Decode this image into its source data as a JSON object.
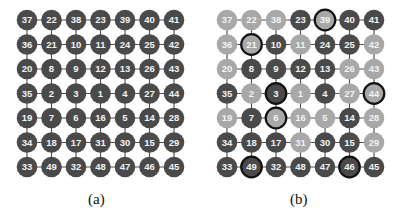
{
  "figure": {
    "panels": [
      {
        "id": "a",
        "caption": "(a)",
        "grid": [
          [
            37,
            22,
            38,
            23,
            39,
            40,
            41
          ],
          [
            36,
            21,
            10,
            11,
            24,
            25,
            42
          ],
          [
            20,
            8,
            9,
            12,
            13,
            26,
            43
          ],
          [
            35,
            2,
            3,
            1,
            4,
            27,
            44
          ],
          [
            19,
            7,
            6,
            16,
            5,
            14,
            28
          ],
          [
            34,
            18,
            17,
            31,
            30,
            15,
            29
          ],
          [
            33,
            49,
            32,
            48,
            47,
            46,
            45
          ]
        ],
        "shades": [
          [
            "D",
            "D",
            "D",
            "D",
            "D",
            "D",
            "D"
          ],
          [
            "D",
            "D",
            "D",
            "D",
            "D",
            "D",
            "D"
          ],
          [
            "D",
            "D",
            "D",
            "D",
            "D",
            "D",
            "D"
          ],
          [
            "D",
            "D",
            "D",
            "D",
            "D",
            "D",
            "D"
          ],
          [
            "D",
            "D",
            "D",
            "D",
            "D",
            "D",
            "D"
          ],
          [
            "D",
            "D",
            "D",
            "D",
            "D",
            "D",
            "D"
          ],
          [
            "D",
            "D",
            "D",
            "D",
            "D",
            "D",
            "D"
          ]
        ],
        "highlighted": []
      },
      {
        "id": "b",
        "caption": "(b)",
        "grid": [
          [
            37,
            22,
            38,
            23,
            39,
            40,
            41
          ],
          [
            36,
            21,
            10,
            11,
            24,
            25,
            42
          ],
          [
            20,
            8,
            9,
            12,
            13,
            26,
            43
          ],
          [
            35,
            2,
            3,
            1,
            4,
            27,
            44
          ],
          [
            19,
            7,
            6,
            16,
            5,
            14,
            28
          ],
          [
            34,
            18,
            17,
            31,
            30,
            15,
            29
          ],
          [
            33,
            49,
            32,
            48,
            47,
            46,
            45
          ]
        ],
        "shades": [
          [
            "L",
            "L",
            "L",
            "D",
            "L",
            "D",
            "D"
          ],
          [
            "L",
            "L",
            "D",
            "L",
            "D",
            "D",
            "L"
          ],
          [
            "L",
            "D",
            "D",
            "D",
            "D",
            "L",
            "L"
          ],
          [
            "D",
            "L",
            "D",
            "L",
            "D",
            "L",
            "L"
          ],
          [
            "L",
            "D",
            "L",
            "L",
            "L",
            "D",
            "L"
          ],
          [
            "D",
            "D",
            "D",
            "L",
            "D",
            "D",
            "L"
          ],
          [
            "D",
            "D",
            "D",
            "D",
            "D",
            "D",
            "D"
          ]
        ],
        "highlighted": [
          39,
          21,
          3,
          44,
          6,
          49,
          46
        ]
      }
    ],
    "colors": {
      "dark": "#4a4a4a",
      "light": "#a8a8a8",
      "edge": "#555555",
      "ring": "#111111",
      "label": "#f2f2f2"
    }
  }
}
